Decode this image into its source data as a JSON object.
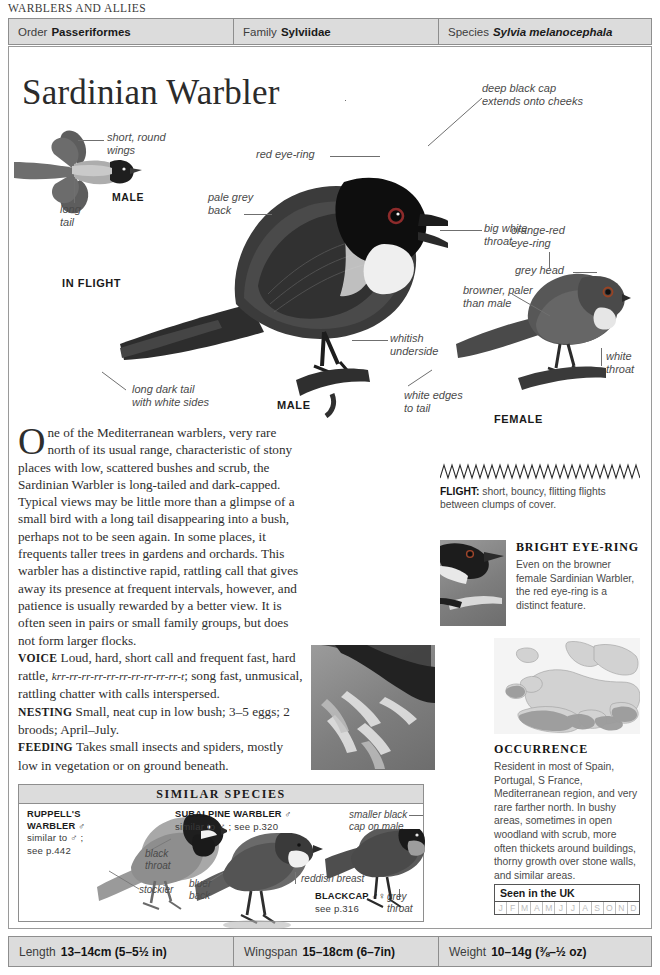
{
  "running_head": "WARBLERS AND ALLIES",
  "taxonomy": {
    "order_label": "Order",
    "order_value": "Passeriformes",
    "family_label": "Family",
    "family_value": "Sylviidae",
    "species_label": "Species",
    "species_value": "Sylvia melanocephala"
  },
  "title": "Sardinian Warbler",
  "illustration": {
    "callouts": {
      "short_round_wings": "short, round\nwings",
      "long_tail": "long\ntail",
      "male_flight": "MALE",
      "in_flight": "IN FLIGHT",
      "red_eye_ring": "red eye-ring",
      "deep_black_cap": "deep black cap\nextends onto cheeks",
      "pale_grey_back": "pale grey\nback",
      "big_white_throat": "big white\nthroat",
      "whitish_underside": "whitish\nunderside",
      "long_dark_tail": "long dark tail\nwith white sides",
      "male_perched": "MALE",
      "orange_red_eye_ring": "orange-red\neye-ring",
      "grey_head": "grey head",
      "browner_paler": "browner, paler\nthan male",
      "white_throat": "white\nthroat",
      "white_edges_to_tail": "white edges\nto tail",
      "female": "FEMALE"
    }
  },
  "body": {
    "dropcap": "O",
    "intro": "ne of the Mediterranean warblers, very rare north of its usual range, characteristic of stony places with low, scattered bushes and scrub, the Sardinian Warbler is long-tailed and dark-capped. Typical views may be little more than a glimpse of a small bird with a long tail disappearing into a bush, perhaps not to be seen again. In some places, it frequents taller trees in gardens and orchards. This warbler has a distinctive rapid, rattling call that gives away its presence at frequent intervals, however, and patience is usually rewarded by a better view. It is often seen in pairs or small family groups, but does not form larger flocks.",
    "voice_label": "VOICE",
    "voice_pre": "Loud, hard, short call and frequent fast, hard rattle, ",
    "voice_italic": "krr-rr-rr-rr-rr-rr-rr-rr-rr-rr-t",
    "voice_post": "; song fast, unmusical, rattling chatter with calls interspersed.",
    "nesting_label": "NESTING",
    "nesting_text": "Small, neat cup in low bush; 3–5 eggs; 2 broods; April–July.",
    "feeding_label": "FEEDING",
    "feeding_text": "Takes small insects and spiders, mostly low in vegetation or on ground beneath."
  },
  "flight": {
    "label": "FLIGHT:",
    "text": " short, bouncy, flitting flights between clumps of cover."
  },
  "eye_ring": {
    "heading": "BRIGHT EYE-RING",
    "text": "Even on the browner female Sardinian Warbler, the red eye-ring is a distinct feature."
  },
  "occurrence": {
    "heading": "OCCURRENCE",
    "text": "Resident in most of Spain, Portugal, S France, Mediterranean region, and very rare farther north. In bushy areas, sometimes in open woodland with scrub, more often thickets around buildings, thorny growth over stone walls, and similar areas."
  },
  "uk": {
    "title": "Seen in the UK",
    "months": [
      "J",
      "F",
      "M",
      "A",
      "M",
      "J",
      "J",
      "A",
      "S",
      "O",
      "N",
      "D"
    ]
  },
  "similar_species": {
    "heading": "SIMILAR SPECIES",
    "ruppells": {
      "name": "RUPPELL'S",
      "name2": "WARBLER ♂",
      "note": "similar to ♂ ;\nsee p.442"
    },
    "ruppells_labels": {
      "black_throat": "black\nthroat",
      "stockier": "stockier"
    },
    "subalpine": {
      "name": "SUBALPINE WARBLER ♂",
      "note": "similar to ♂ ; see p.320"
    },
    "subalpine_labels": {
      "bluer_back": "bluer\nback",
      "reddish_breast": "reddish breast"
    },
    "blackcap": {
      "name": "BLACKCAP ♂♀ ;",
      "note": "see p.316"
    },
    "blackcap_labels": {
      "smaller_black_cap": "smaller black\ncap on male",
      "grey_throat": "grey\nthroat"
    }
  },
  "measurements": {
    "length_label": "Length",
    "length_value": "13–14cm (5–5½ in)",
    "wingspan_label": "Wingspan",
    "wingspan_value": "15–18cm (6–7in)",
    "weight_label": "Weight",
    "weight_value": "10–14g (⅜–½ oz)"
  }
}
